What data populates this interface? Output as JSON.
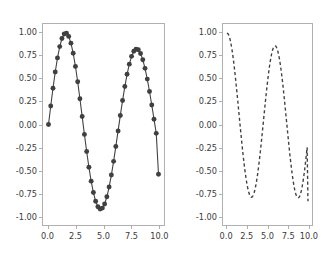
{
  "figure": {
    "background_color": "#ffffff",
    "width": 331,
    "height": 254,
    "line_color": "#404040",
    "spine_color": "#b0b0b0",
    "tick_label_color": "#3a3a3a"
  },
  "chart_data": [
    {
      "type": "line",
      "name": "left-subplot",
      "title": "",
      "xlabel": "",
      "ylabel": "",
      "xlim": [
        -0.5,
        10.5
      ],
      "ylim": [
        -1.1,
        1.1
      ],
      "grid": false,
      "legend": null,
      "linestyle": "solid",
      "marker": "circle",
      "color": "#404040",
      "xticks": [
        "0.0",
        "2.5",
        "5.0",
        "7.5",
        "10.0"
      ],
      "xtick_values": [
        0.0,
        2.5,
        5.0,
        7.5,
        10.0
      ],
      "yticks": [
        "-1.00",
        "-0.75",
        "-0.50",
        "-0.25",
        "0.00",
        "0.25",
        "0.50",
        "0.75",
        "1.00"
      ],
      "ytick_values": [
        -1.0,
        -0.75,
        -0.5,
        -0.25,
        0.0,
        0.25,
        0.5,
        0.75,
        1.0
      ],
      "x": [
        0.0,
        0.2041,
        0.4082,
        0.6122,
        0.8163,
        1.0204,
        1.2245,
        1.4286,
        1.6327,
        1.8367,
        2.0408,
        2.2449,
        2.449,
        2.6531,
        2.8571,
        3.0612,
        3.2653,
        3.4694,
        3.6735,
        3.8776,
        4.0816,
        4.2857,
        4.4898,
        4.6939,
        4.898,
        5.102,
        5.3061,
        5.5102,
        5.7143,
        5.9184,
        6.1224,
        6.3265,
        6.5306,
        6.7347,
        6.9388,
        7.1429,
        7.3469,
        7.551,
        7.7551,
        7.9592,
        8.1633,
        8.3673,
        8.5714,
        8.7755,
        8.9796,
        9.1837,
        9.3878,
        9.5918,
        9.7959,
        10.0
      ],
      "y": [
        0.0,
        0.2027,
        0.3969,
        0.5745,
        0.7291,
        0.8526,
        0.9409,
        0.9898,
        0.998,
        0.9644,
        0.8905,
        0.7795,
        0.6362,
        0.4679,
        0.2817,
        0.0865,
        -0.1082,
        -0.2955,
        -0.4684,
        -0.62,
        -0.7452,
        -0.8398,
        -0.9005,
        -0.9258,
        -0.9152,
        -0.8698,
        -0.7919,
        -0.685,
        -0.5537,
        -0.4034,
        -0.2403,
        -0.0706,
        0.0993,
        0.2632,
        0.415,
        0.5492,
        0.6608,
        0.7458,
        0.8011,
        0.8251,
        0.8172,
        0.778,
        0.7095,
        0.6144,
        0.4968,
        0.3612,
        0.2131,
        0.0584,
        -0.0971,
        -0.544
      ]
    },
    {
      "type": "line",
      "name": "right-subplot",
      "title": "",
      "xlabel": "",
      "ylabel": "",
      "xlim": [
        -0.5,
        10.5
      ],
      "ylim": [
        -1.1,
        1.1
      ],
      "grid": false,
      "legend": null,
      "linestyle": "dashed",
      "marker": "none",
      "color": "#404040",
      "xticks": [
        "0.0",
        "2.5",
        "5.0",
        "7.5",
        "10.0"
      ],
      "xtick_values": [
        0.0,
        2.5,
        5.0,
        7.5,
        10.0
      ],
      "yticks": [
        "-1.00",
        "-0.75",
        "-0.50",
        "-0.25",
        "0.00",
        "0.25",
        "0.50",
        "0.75",
        "1.00"
      ],
      "ytick_values": [
        -1.0,
        -0.75,
        -0.5,
        -0.25,
        0.0,
        0.25,
        0.5,
        0.75,
        1.0
      ],
      "x": [
        0.0,
        0.102,
        0.204,
        0.306,
        0.408,
        0.51,
        0.612,
        0.714,
        0.816,
        0.918,
        1.02,
        1.122,
        1.224,
        1.327,
        1.429,
        1.531,
        1.633,
        1.735,
        1.837,
        1.939,
        2.041,
        2.143,
        2.245,
        2.347,
        2.449,
        2.551,
        2.653,
        2.755,
        2.857,
        2.959,
        3.061,
        3.163,
        3.265,
        3.367,
        3.469,
        3.571,
        3.673,
        3.776,
        3.878,
        3.98,
        4.082,
        4.184,
        4.286,
        4.388,
        4.49,
        4.592,
        4.694,
        4.796,
        4.898,
        5.0,
        5.102,
        5.204,
        5.306,
        5.408,
        5.51,
        5.612,
        5.714,
        5.816,
        5.918,
        6.02,
        6.122,
        6.224,
        6.327,
        6.429,
        6.531,
        6.633,
        6.735,
        6.837,
        6.939,
        7.041,
        7.143,
        7.245,
        7.347,
        7.449,
        7.551,
        7.653,
        7.755,
        7.857,
        7.959,
        8.061,
        8.163,
        8.265,
        8.367,
        8.469,
        8.571,
        8.673,
        8.776,
        8.878,
        8.98,
        9.082,
        9.184,
        9.286,
        9.388,
        9.49,
        9.592,
        9.694,
        9.796,
        9.898,
        10.0
      ],
      "y": [
        1.0,
        0.9948,
        0.9793,
        0.9535,
        0.9177,
        0.8725,
        0.8183,
        0.7559,
        0.686,
        0.6094,
        0.5272,
        0.4403,
        0.3497,
        0.2566,
        0.162,
        0.067,
        -0.0273,
        -0.12,
        -0.2101,
        -0.2966,
        -0.3786,
        -0.4552,
        -0.5257,
        -0.5892,
        -0.6452,
        -0.693,
        -0.7321,
        -0.7622,
        -0.7829,
        -0.794,
        -0.7954,
        -0.7871,
        -0.7691,
        -0.7417,
        -0.7052,
        -0.6599,
        -0.6064,
        -0.5452,
        -0.4771,
        -0.4028,
        -0.3232,
        -0.2392,
        -0.1517,
        -0.0619,
        0.0292,
        0.1204,
        0.2107,
        0.2988,
        0.3838,
        0.4646,
        0.5402,
        0.6096,
        0.672,
        0.7266,
        0.7726,
        0.8095,
        0.8367,
        0.8539,
        0.8608,
        0.8573,
        0.8434,
        0.8192,
        0.785,
        0.7412,
        0.6884,
        0.6272,
        0.5584,
        0.4829,
        0.4017,
        0.3157,
        0.2262,
        0.1343,
        0.0412,
        -0.0519,
        -0.144,
        -0.2339,
        -0.3205,
        -0.4027,
        -0.4796,
        -0.5501,
        -0.6134,
        -0.6687,
        -0.7152,
        -0.7523,
        -0.7796,
        -0.7966,
        -0.8031,
        -0.7991,
        -0.7845,
        -0.7595,
        -0.7245,
        -0.6798,
        -0.6261,
        -0.564,
        -0.4944,
        -0.4181,
        -0.3362,
        -0.2498,
        -0.8391
      ]
    }
  ]
}
